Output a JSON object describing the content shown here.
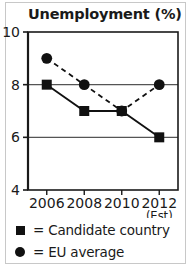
{
  "chart_data": {
    "type": "line",
    "title": "Unemployment (%)",
    "xlabel": "",
    "ylabel": "",
    "categories": [
      "2006",
      "2008",
      "2010",
      "2012"
    ],
    "x_tick_sublabels": [
      "",
      "",
      "",
      "(Est)"
    ],
    "ylim": [
      4,
      10
    ],
    "y_ticks": [
      4,
      6,
      8,
      10
    ],
    "y_tick_labels": [
      "4",
      "6",
      "8",
      "10"
    ],
    "gridlines": [
      6,
      8
    ],
    "grid": true,
    "legend_position": "below",
    "series": [
      {
        "name": "Candidate country",
        "marker": "square",
        "linestyle": "solid",
        "color": "#111111",
        "values": [
          8,
          7,
          7,
          6
        ]
      },
      {
        "name": "EU average",
        "marker": "circle",
        "linestyle": "dashed",
        "color": "#111111",
        "values": [
          9,
          8,
          7,
          8
        ]
      }
    ]
  },
  "legend": {
    "equals": "=",
    "items": [
      {
        "marker": "square-marker",
        "label": "= Candidate country"
      },
      {
        "marker": "circle-marker",
        "label": "= EU average"
      }
    ]
  },
  "colors": {
    "ink": "#111111",
    "frame": "#1a1a1a",
    "grid": "#555555",
    "outer_border": "#c8c8c8",
    "background": "#ffffff"
  }
}
